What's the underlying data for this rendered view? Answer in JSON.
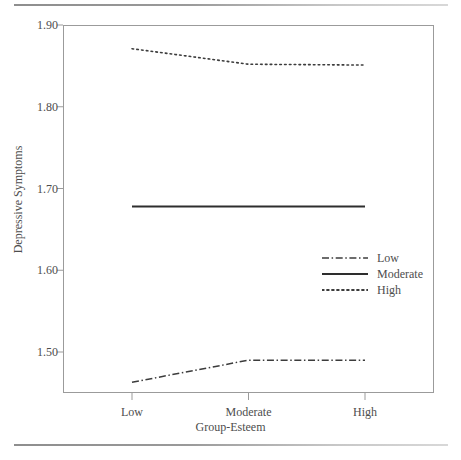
{
  "chart_data": {
    "type": "line",
    "title": "",
    "xlabel": "Group-Esteem",
    "ylabel": "Depressive Symptoms",
    "categories": [
      "Low",
      "Moderate",
      "High"
    ],
    "xtick_labels": [
      "Low",
      "Moderate",
      "High"
    ],
    "ytick_labels": [
      "1.90",
      "1.80",
      "1.70",
      "1.60",
      "1.50"
    ],
    "ytick_values": [
      1.9,
      1.8,
      1.7,
      1.6,
      1.5
    ],
    "ylim": [
      1.45,
      1.9
    ],
    "xlim": [
      0,
      2
    ],
    "grid": false,
    "legend_position": "center-right",
    "series": [
      {
        "name": "Low",
        "label": "Low",
        "linestyle": "dashdot",
        "color": "#3c3c3c",
        "values": [
          1.463,
          1.49,
          1.49
        ]
      },
      {
        "name": "Moderate",
        "label": "Moderate",
        "linestyle": "solid",
        "color": "#2e2e2e",
        "values": [
          1.678,
          1.678,
          1.678
        ]
      },
      {
        "name": "High",
        "label": "High",
        "linestyle": "dotted",
        "color": "#3c3c3c",
        "values": [
          1.871,
          1.852,
          1.851
        ]
      }
    ]
  },
  "axes": {
    "y_title": "Depressive Symptoms",
    "x_title": "Group-Esteem",
    "y_ticks": [
      {
        "label": "1.90"
      },
      {
        "label": "1.80"
      },
      {
        "label": "1.70"
      },
      {
        "label": "1.60"
      },
      {
        "label": "1.50"
      }
    ],
    "x_ticks": [
      {
        "label": "Low"
      },
      {
        "label": "Moderate"
      },
      {
        "label": "High"
      }
    ]
  },
  "legend": {
    "items": [
      {
        "label": "Low",
        "style": "dashdot"
      },
      {
        "label": "Moderate",
        "style": "solid"
      },
      {
        "label": "High",
        "style": "dotted"
      }
    ]
  }
}
